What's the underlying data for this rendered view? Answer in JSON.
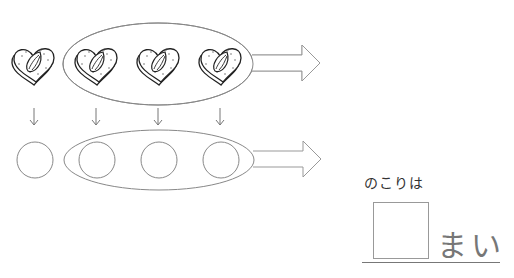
{
  "problem": {
    "cookie_count_total": 4,
    "cookie_count_taken": 3,
    "cookie_icon": "heart-cookie-with-almond-icon",
    "placeholder_icon": "circle-placeholder",
    "down_arrow_count": 4,
    "group_arrow_icon": "right-block-arrow-icon"
  },
  "answer": {
    "label": "のこりは",
    "value": "",
    "unit": "まい"
  },
  "colors": {
    "stroke": "#888888",
    "ink": "#222222",
    "text": "#333333"
  }
}
